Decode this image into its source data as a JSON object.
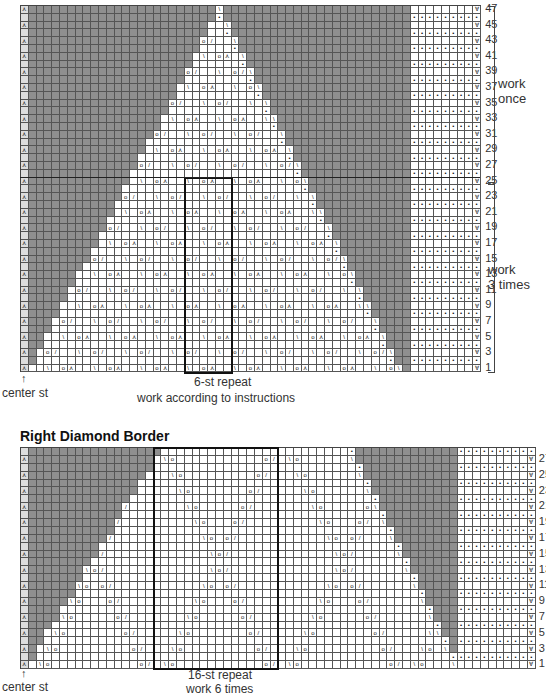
{
  "top_chart": {
    "row_numbers": [
      "47",
      "45",
      "43",
      "41",
      "39",
      "37",
      "35",
      "33",
      "31",
      "29",
      "27",
      "25",
      "23",
      "21",
      "19",
      "17",
      "15",
      "13",
      "11",
      "9",
      "7",
      "5",
      "3",
      "1"
    ],
    "work_once": [
      "work",
      "once"
    ],
    "work_3_times": [
      "work",
      "3 times"
    ],
    "center_label": "center st",
    "center_arrow": "↑",
    "repeat_label": "6-st repeat",
    "repeat_instructions": "work according to instructions"
  },
  "bottom_chart": {
    "title": "Right Diamond Border",
    "row_numbers": [
      "27",
      "25",
      "23",
      "21",
      "19",
      "17",
      "15",
      "13",
      "11",
      "9",
      "7",
      "5",
      "3",
      "1"
    ],
    "center_label": "center st",
    "center_arrow": "↑",
    "repeat_label": "16-st repeat",
    "repeat_instructions": "work 6 times"
  },
  "symbols": {
    "yo": "o",
    "k2tog": "/",
    "ssk": "\\",
    "s2kp": "⋏",
    "purl": "•",
    "slip": "∀",
    "center_dec": "⋏"
  },
  "colors": {
    "no_stitch": "#8f8f8f",
    "grid": "#555555",
    "repeat_outline": "#111111"
  }
}
